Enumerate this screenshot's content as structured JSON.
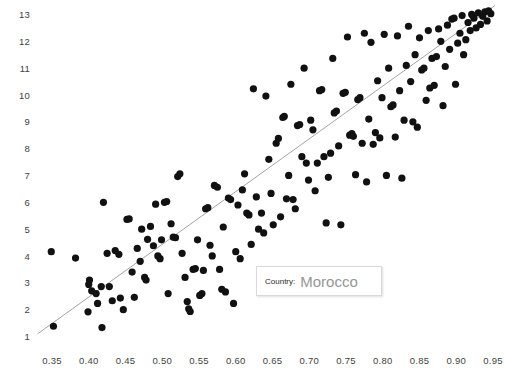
{
  "tooltip": {
    "field_label": "Country:",
    "field_value": "Morocco"
  },
  "style": {
    "point_color": "#111111",
    "trendline_color": "#9a9a9a",
    "tick_label_color": "#3f3f3f",
    "background": "#ffffff",
    "tooltip_border": "#d9d9d9",
    "tooltip_value_color": "#969696"
  },
  "chart_data": {
    "type": "scatter",
    "title": "",
    "xlabel": "",
    "ylabel": "",
    "xlim": [
      0.325,
      0.965
    ],
    "ylim": [
      0.6,
      13.35
    ],
    "grid": false,
    "legend": false,
    "xticks": [
      "0.35",
      "0.40",
      "0.45",
      "0.50",
      "0.55",
      "0.60",
      "0.65",
      "0.70",
      "0.75",
      "0.80",
      "0.85",
      "0.90",
      "0.95"
    ],
    "yticks": [
      "1",
      "2",
      "3",
      "4",
      "5",
      "6",
      "7",
      "8",
      "9",
      "10",
      "11",
      "12",
      "13"
    ],
    "xtick_values": [
      0.35,
      0.4,
      0.45,
      0.5,
      0.55,
      0.6,
      0.65,
      0.7,
      0.75,
      0.8,
      0.85,
      0.9,
      0.95
    ],
    "ytick_values": [
      1,
      2,
      3,
      4,
      5,
      6,
      7,
      8,
      9,
      10,
      11,
      12,
      13
    ],
    "trendline": {
      "x": [
        0.3305,
        0.9525
      ],
      "y": [
        1.12,
        13.35
      ]
    },
    "series": [
      {
        "name": "countries",
        "marker": "circle",
        "marker_size": 4.6,
        "color": "#111111",
        "points": [
          [
            0.349,
            4.18
          ],
          [
            0.352,
            1.4
          ],
          [
            0.382,
            3.94
          ],
          [
            0.4,
            2.96
          ],
          [
            0.401,
            3.12
          ],
          [
            0.399,
            1.94
          ],
          [
            0.404,
            2.72
          ],
          [
            0.41,
            2.62
          ],
          [
            0.412,
            2.25
          ],
          [
            0.417,
            2.88
          ],
          [
            0.418,
            1.35
          ],
          [
            0.42,
            6.02
          ],
          [
            0.425,
            4.12
          ],
          [
            0.428,
            2.88
          ],
          [
            0.432,
            2.35
          ],
          [
            0.436,
            4.22
          ],
          [
            0.441,
            4.08
          ],
          [
            0.443,
            2.45
          ],
          [
            0.447,
            2.02
          ],
          [
            0.452,
            5.38
          ],
          [
            0.455,
            5.4
          ],
          [
            0.459,
            3.42
          ],
          [
            0.462,
            2.48
          ],
          [
            0.466,
            4.3
          ],
          [
            0.47,
            3.82
          ],
          [
            0.472,
            5.02
          ],
          [
            0.476,
            3.22
          ],
          [
            0.478,
            3.12
          ],
          [
            0.48,
            4.64
          ],
          [
            0.484,
            5.12
          ],
          [
            0.488,
            4.4
          ],
          [
            0.491,
            5.95
          ],
          [
            0.494,
            4.02
          ],
          [
            0.497,
            3.92
          ],
          [
            0.499,
            4.62
          ],
          [
            0.503,
            6.02
          ],
          [
            0.506,
            6.05
          ],
          [
            0.508,
            2.62
          ],
          [
            0.512,
            5.22
          ],
          [
            0.515,
            4.72
          ],
          [
            0.518,
            4.7
          ],
          [
            0.521,
            6.98
          ],
          [
            0.524,
            7.08
          ],
          [
            0.527,
            4.12
          ],
          [
            0.531,
            3.22
          ],
          [
            0.534,
            2.32
          ],
          [
            0.538,
            1.95
          ],
          [
            0.536,
            2.05
          ],
          [
            0.542,
            3.52
          ],
          [
            0.545,
            3.55
          ],
          [
            0.548,
            4.62
          ],
          [
            0.551,
            2.55
          ],
          [
            0.554,
            2.62
          ],
          [
            0.556,
            3.48
          ],
          [
            0.559,
            5.78
          ],
          [
            0.562,
            5.82
          ],
          [
            0.565,
            4.42
          ],
          [
            0.568,
            4.02
          ],
          [
            0.571,
            6.65
          ],
          [
            0.575,
            6.58
          ],
          [
            0.578,
            3.52
          ],
          [
            0.581,
            2.78
          ],
          [
            0.583,
            5.1
          ],
          [
            0.586,
            2.68
          ],
          [
            0.59,
            6.18
          ],
          [
            0.593,
            6.12
          ],
          [
            0.597,
            2.25
          ],
          [
            0.6,
            4.18
          ],
          [
            0.603,
            5.92
          ],
          [
            0.606,
            3.92
          ],
          [
            0.609,
            6.48
          ],
          [
            0.612,
            7.08
          ],
          [
            0.615,
            5.62
          ],
          [
            0.618,
            5.55
          ],
          [
            0.621,
            4.45
          ],
          [
            0.624,
            10.25
          ],
          [
            0.628,
            6.22
          ],
          [
            0.631,
            5.02
          ],
          [
            0.635,
            5.62
          ],
          [
            0.638,
            4.88
          ],
          [
            0.641,
            9.98
          ],
          [
            0.645,
            7.62
          ],
          [
            0.648,
            6.35
          ],
          [
            0.651,
            5.18
          ],
          [
            0.655,
            8.22
          ],
          [
            0.658,
            8.4
          ],
          [
            0.661,
            5.48
          ],
          [
            0.664,
            9.18
          ],
          [
            0.666,
            9.22
          ],
          [
            0.669,
            6.15
          ],
          [
            0.672,
            7.02
          ],
          [
            0.675,
            10.42
          ],
          [
            0.678,
            6.12
          ],
          [
            0.681,
            5.78
          ],
          [
            0.684,
            8.88
          ],
          [
            0.687,
            8.92
          ],
          [
            0.69,
            7.72
          ],
          [
            0.693,
            11.02
          ],
          [
            0.696,
            7.48
          ],
          [
            0.699,
            6.85
          ],
          [
            0.702,
            9.08
          ],
          [
            0.705,
            8.72
          ],
          [
            0.708,
            6.45
          ],
          [
            0.711,
            7.48
          ],
          [
            0.714,
            10.18
          ],
          [
            0.717,
            10.22
          ],
          [
            0.72,
            7.72
          ],
          [
            0.723,
            5.25
          ],
          [
            0.726,
            6.95
          ],
          [
            0.729,
            7.85
          ],
          [
            0.732,
            11.38
          ],
          [
            0.734,
            9.35
          ],
          [
            0.737,
            9.42
          ],
          [
            0.74,
            8.12
          ],
          [
            0.743,
            5.18
          ],
          [
            0.746,
            10.08
          ],
          [
            0.749,
            10.12
          ],
          [
            0.752,
            12.18
          ],
          [
            0.755,
            8.52
          ],
          [
            0.758,
            8.58
          ],
          [
            0.76,
            8.48
          ],
          [
            0.763,
            7.05
          ],
          [
            0.766,
            9.85
          ],
          [
            0.769,
            9.92
          ],
          [
            0.772,
            8.22
          ],
          [
            0.775,
            12.32
          ],
          [
            0.778,
            6.78
          ],
          [
            0.781,
            9.12
          ],
          [
            0.784,
            11.98
          ],
          [
            0.787,
            8.18
          ],
          [
            0.79,
            8.62
          ],
          [
            0.793,
            10.55
          ],
          [
            0.796,
            8.42
          ],
          [
            0.799,
            9.92
          ],
          [
            0.802,
            12.28
          ],
          [
            0.805,
            7.02
          ],
          [
            0.808,
            11.02
          ],
          [
            0.811,
            9.58
          ],
          [
            0.814,
            9.65
          ],
          [
            0.817,
            8.45
          ],
          [
            0.82,
            12.22
          ],
          [
            0.823,
            10.18
          ],
          [
            0.826,
            6.92
          ],
          [
            0.829,
            9.08
          ],
          [
            0.832,
            11.12
          ],
          [
            0.835,
            12.58
          ],
          [
            0.838,
            10.52
          ],
          [
            0.841,
            9.02
          ],
          [
            0.844,
            11.52
          ],
          [
            0.847,
            8.82
          ],
          [
            0.85,
            12.15
          ],
          [
            0.853,
            10.95
          ],
          [
            0.856,
            11.02
          ],
          [
            0.859,
            9.82
          ],
          [
            0.862,
            12.42
          ],
          [
            0.864,
            10.28
          ],
          [
            0.867,
            11.38
          ],
          [
            0.87,
            10.38
          ],
          [
            0.873,
            11.45
          ],
          [
            0.876,
            12.48
          ],
          [
            0.879,
            12.02
          ],
          [
            0.882,
            9.62
          ],
          [
            0.885,
            11.08
          ],
          [
            0.888,
            12.62
          ],
          [
            0.891,
            11.72
          ],
          [
            0.894,
            12.85
          ],
          [
            0.897,
            12.88
          ],
          [
            0.899,
            10.42
          ],
          [
            0.902,
            11.95
          ],
          [
            0.905,
            12.32
          ],
          [
            0.908,
            12.98
          ],
          [
            0.91,
            11.52
          ],
          [
            0.913,
            12.08
          ],
          [
            0.916,
            12.72
          ],
          [
            0.919,
            12.42
          ],
          [
            0.921,
            13.02
          ],
          [
            0.924,
            12.88
          ],
          [
            0.927,
            12.52
          ],
          [
            0.93,
            13.08
          ],
          [
            0.933,
            12.65
          ],
          [
            0.936,
            12.95
          ],
          [
            0.939,
            13.12
          ],
          [
            0.942,
            12.78
          ],
          [
            0.944,
            13.15
          ],
          [
            0.947,
            13.05
          ]
        ]
      }
    ]
  }
}
